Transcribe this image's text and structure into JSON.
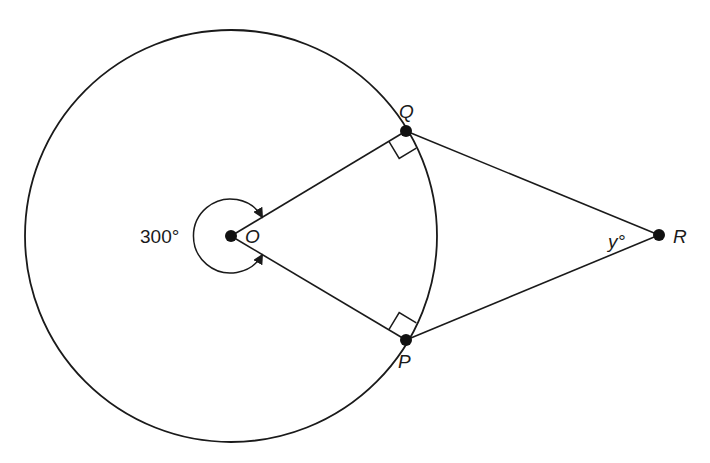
{
  "diagram": {
    "type": "circle-tangents",
    "center": {
      "label": "O",
      "x": 231,
      "y": 236
    },
    "circle_radius": 206,
    "points": {
      "Q": {
        "label": "Q",
        "x": 406,
        "y": 131
      },
      "P": {
        "label": "P",
        "x": 406,
        "y": 340
      },
      "R": {
        "label": "R",
        "x": 659,
        "y": 235
      }
    },
    "reflex_angle_label": "300°",
    "angle_R_label": "y°",
    "right_angles": [
      "OQR",
      "OPR"
    ],
    "colors": {
      "stroke": "#1a1a1a",
      "background": "#ffffff"
    }
  }
}
